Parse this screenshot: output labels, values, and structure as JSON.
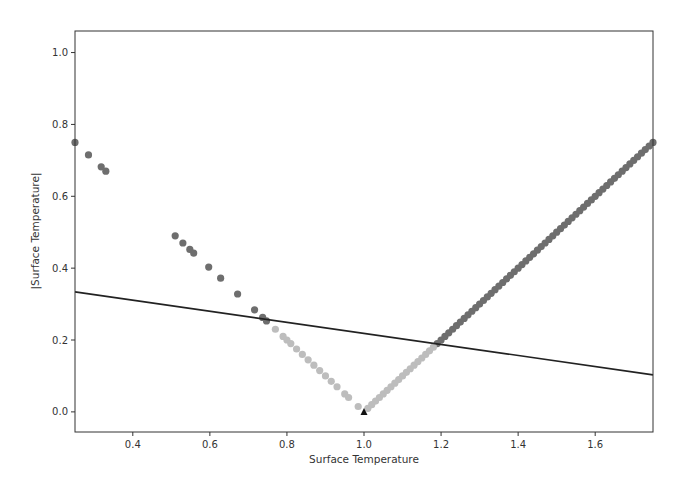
{
  "chart_data": {
    "type": "scatter",
    "title": "",
    "xlabel": "Surface Temperature",
    "ylabel": "|Surface Temperature|",
    "xlim": [
      0.25,
      1.75
    ],
    "ylim": [
      -0.056,
      1.06
    ],
    "grid": false,
    "legend": null,
    "xticks": [
      0.4,
      0.6,
      0.8,
      1.0,
      1.2,
      1.4,
      1.6
    ],
    "xtick_labels": [
      "0.4",
      "0.6",
      "0.8",
      "1.0",
      "1.2",
      "1.4",
      "1.6"
    ],
    "yticks": [
      0.0,
      0.2,
      0.4,
      0.6,
      0.8,
      1.0
    ],
    "ytick_labels": [
      "0.0",
      "0.2",
      "0.4",
      "0.6",
      "0.8",
      "1.0"
    ],
    "colors": {
      "above_line": "#6e6e6e",
      "below_line": "#bdbdbd",
      "line": "#222222",
      "marker": "#111111",
      "axes": "#333333"
    },
    "series": [
      {
        "name": "points above line",
        "kind": "scatter",
        "color": "#6e6e6e",
        "x": [
          0.25,
          0.285,
          0.318,
          0.33,
          0.51,
          0.53,
          0.548,
          0.558,
          0.597,
          0.628,
          0.672,
          0.716,
          0.737,
          0.747,
          1.19,
          1.2,
          1.21,
          1.22,
          1.23,
          1.24,
          1.25,
          1.26,
          1.27,
          1.28,
          1.29,
          1.3,
          1.31,
          1.32,
          1.33,
          1.34,
          1.35,
          1.36,
          1.37,
          1.38,
          1.39,
          1.4,
          1.41,
          1.42,
          1.43,
          1.44,
          1.45,
          1.46,
          1.47,
          1.48,
          1.49,
          1.5,
          1.51,
          1.52,
          1.53,
          1.54,
          1.55,
          1.56,
          1.57,
          1.58,
          1.59,
          1.6,
          1.61,
          1.62,
          1.63,
          1.64,
          1.65,
          1.66,
          1.67,
          1.68,
          1.69,
          1.7,
          1.71,
          1.72,
          1.73,
          1.74,
          1.75
        ],
        "y": [
          0.75,
          0.715,
          0.682,
          0.67,
          0.49,
          0.47,
          0.452,
          0.442,
          0.403,
          0.372,
          0.328,
          0.284,
          0.263,
          0.253,
          0.19,
          0.2,
          0.21,
          0.22,
          0.23,
          0.24,
          0.25,
          0.26,
          0.27,
          0.28,
          0.29,
          0.3,
          0.31,
          0.32,
          0.33,
          0.34,
          0.35,
          0.36,
          0.37,
          0.38,
          0.39,
          0.4,
          0.41,
          0.42,
          0.43,
          0.44,
          0.45,
          0.46,
          0.47,
          0.48,
          0.49,
          0.5,
          0.51,
          0.52,
          0.53,
          0.54,
          0.55,
          0.56,
          0.57,
          0.58,
          0.59,
          0.6,
          0.61,
          0.62,
          0.63,
          0.64,
          0.65,
          0.66,
          0.67,
          0.68,
          0.69,
          0.7,
          0.71,
          0.72,
          0.73,
          0.74,
          0.75
        ]
      },
      {
        "name": "points below line",
        "kind": "scatter",
        "color": "#bdbdbd",
        "x": [
          0.77,
          0.79,
          0.8,
          0.81,
          0.825,
          0.84,
          0.855,
          0.87,
          0.885,
          0.9,
          0.915,
          0.93,
          0.95,
          0.96,
          0.985,
          1.01,
          1.02,
          1.03,
          1.04,
          1.05,
          1.06,
          1.07,
          1.08,
          1.09,
          1.1,
          1.11,
          1.12,
          1.13,
          1.14,
          1.15,
          1.16,
          1.17,
          1.18
        ],
        "y": [
          0.23,
          0.21,
          0.2,
          0.19,
          0.175,
          0.16,
          0.145,
          0.13,
          0.115,
          0.1,
          0.085,
          0.07,
          0.05,
          0.04,
          0.015,
          0.01,
          0.02,
          0.03,
          0.04,
          0.05,
          0.06,
          0.07,
          0.08,
          0.09,
          0.1,
          0.11,
          0.12,
          0.13,
          0.14,
          0.15,
          0.16,
          0.17,
          0.18
        ]
      },
      {
        "name": "minimum marker",
        "kind": "marker",
        "marker": "triangle",
        "color": "#111111",
        "x": [
          1.0
        ],
        "y": [
          0.0
        ]
      },
      {
        "name": "fitted line",
        "kind": "line",
        "color": "#222222",
        "x": [
          0.25,
          1.75
        ],
        "y": [
          0.334,
          0.103
        ]
      }
    ]
  }
}
